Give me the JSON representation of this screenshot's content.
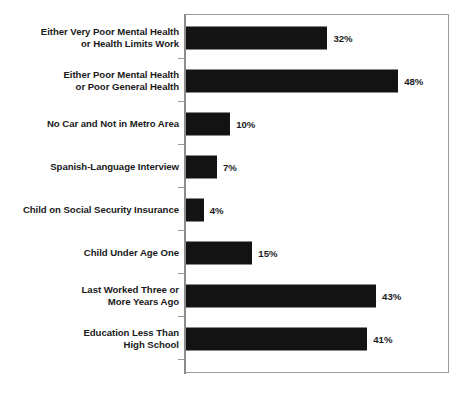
{
  "chart_data": {
    "type": "bar",
    "orientation": "horizontal",
    "title": "",
    "subtitle": "",
    "xlabel": "",
    "ylabel": "",
    "xlim": [
      0,
      60
    ],
    "grid": false,
    "legend": false,
    "value_label_suffix": "%",
    "bar_color": "#131313",
    "frame_color": "#9b9b9b",
    "label_color": "#1a1a1a",
    "categories": [
      "Either Very Poor Mental Health\nor Health Limits Work",
      "Either Poor Mental Health\nor Poor General Health",
      "No Car and Not in Metro Area",
      "Spanish-Language Interview",
      "Child on Social Security Insurance",
      "Child Under Age One",
      "Last Worked Three or\nMore Years Ago",
      "Education Less Than\nHigh School"
    ],
    "values": [
      32,
      48,
      10,
      7,
      4,
      15,
      43,
      41
    ],
    "value_labels": [
      "32%",
      "48%",
      "10%",
      "7%",
      "4%",
      "15%",
      "43%",
      "41%"
    ]
  }
}
